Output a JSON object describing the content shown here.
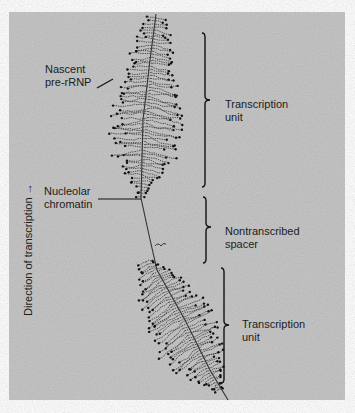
{
  "figure": {
    "background": "#c6c6c6",
    "panel": {
      "x": 9,
      "y": 12,
      "w": 336,
      "h": 388
    },
    "ink": "#2a2a2a"
  },
  "labels": {
    "nascent": {
      "line1": "Nascent",
      "line2": "pre-rRNP"
    },
    "chromatin": {
      "line1": "Nucleolar",
      "line2": "chromatin"
    },
    "direction": "Direction of transcription",
    "unit_top": {
      "line1": "Transcription",
      "line2": "unit"
    },
    "spacer": {
      "line1": "Nontranscribed",
      "line2": "spacer"
    },
    "unit_bottom": {
      "line1": "Transcription",
      "line2": "unit"
    }
  },
  "braces": [
    {
      "name": "transcription-unit-top",
      "x": 205,
      "y1": 33,
      "y2": 187,
      "tip": 100
    },
    {
      "name": "nontranscribed-spacer",
      "x": 206,
      "y1": 197,
      "y2": 263,
      "tip": 227
    },
    {
      "name": "transcription-unit-bottom",
      "x": 224,
      "y1": 268,
      "y2": 383,
      "tip": 325
    }
  ],
  "fiber": [
    [
      156,
      14
    ],
    [
      150,
      60
    ],
    [
      143,
      120
    ],
    [
      141,
      198
    ],
    [
      149,
      235
    ],
    [
      157,
      270
    ],
    [
      185,
      320
    ],
    [
      210,
      370
    ],
    [
      228,
      400
    ]
  ],
  "trees": [
    {
      "name": "upper-tree",
      "start": [
        156,
        18
      ],
      "end": [
        141,
        196
      ],
      "maxLen": 32,
      "count": 60,
      "widest": 0.45
    },
    {
      "name": "lower-tree",
      "start": [
        146,
        262
      ],
      "end": [
        218,
        390
      ],
      "maxLen": 30,
      "count": 55,
      "widest": 0.15
    }
  ]
}
